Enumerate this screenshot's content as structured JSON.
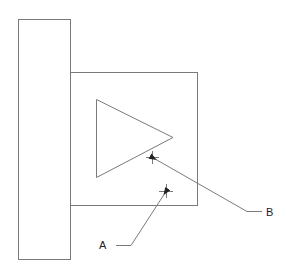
{
  "diagram": {
    "type": "technical-drawing",
    "colors": {
      "line": "#7a7a7a",
      "text": "#222222",
      "background": "#ffffff"
    },
    "shapes": {
      "tall_rectangle": {
        "x": 18,
        "y": 19,
        "width": 52,
        "height": 240
      },
      "square": {
        "x": 70,
        "y": 72,
        "width": 127,
        "height": 133
      },
      "triangle": {
        "points": [
          [
            96,
            99
          ],
          [
            96,
            177
          ],
          [
            173,
            137
          ]
        ]
      }
    },
    "markers": [
      {
        "id": "A",
        "cx": 166,
        "cy": 191
      },
      {
        "id": "B",
        "cx": 152,
        "cy": 157
      }
    ],
    "callouts": [
      {
        "label": "A",
        "text_x": 99,
        "text_y": 249,
        "leader": [
          [
            164,
            194
          ],
          [
            131,
            245
          ],
          [
            116,
            245
          ]
        ]
      },
      {
        "label": "B",
        "text_x": 266,
        "text_y": 216,
        "leader": [
          [
            155,
            159
          ],
          [
            247,
            211
          ],
          [
            262,
            211
          ]
        ]
      }
    ],
    "labels": {
      "a": "A",
      "b": "B"
    }
  }
}
